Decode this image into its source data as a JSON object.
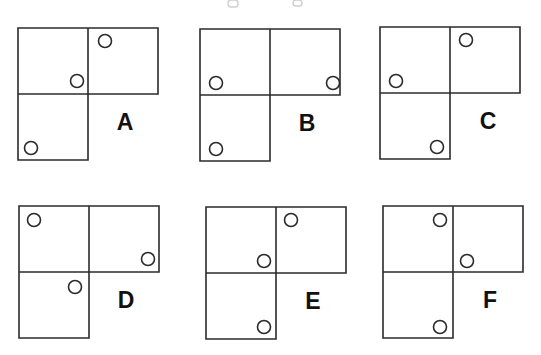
{
  "page": {
    "background_color": "#ffffff",
    "stroke_color": "#2b2b2b",
    "label_color": "#111111",
    "line_width": 1.6,
    "circle_radius": 6.5,
    "circle_stroke_width": 1.6,
    "cell_width": 70,
    "cell_height": 66,
    "label_font_size": 23
  },
  "chart_data": {
    "type": "diagram",
    "shape_description": "Each figure is an L-tromino of three unit squares: top-left, top-right and bottom-left. Each figure carries three small open circles.",
    "figures": [
      {
        "label": "A",
        "origin_x": 18,
        "origin_y": 28,
        "label_x": 125,
        "label_y": 130,
        "squares": [
          "top-left",
          "top-right",
          "bottom-left"
        ],
        "circles": [
          {
            "cx": 105,
            "cy": 41,
            "cell": "top-right",
            "position": "top-left"
          },
          {
            "cx": 77,
            "cy": 81,
            "cell": "top-left",
            "position": "bottom-right"
          },
          {
            "cx": 31,
            "cy": 148,
            "cell": "bottom-left",
            "position": "bottom-left"
          }
        ]
      },
      {
        "label": "B",
        "origin_x": 200,
        "origin_y": 29,
        "label_x": 307,
        "label_y": 131,
        "squares": [
          "top-left",
          "top-right",
          "bottom-left"
        ],
        "circles": [
          {
            "cx": 216,
            "cy": 83,
            "cell": "top-left",
            "position": "bottom-left"
          },
          {
            "cx": 333,
            "cy": 83,
            "cell": "top-right",
            "position": "bottom-right"
          },
          {
            "cx": 216,
            "cy": 149,
            "cell": "bottom-left",
            "position": "bottom-left"
          }
        ]
      },
      {
        "label": "C",
        "origin_x": 380,
        "origin_y": 27,
        "label_x": 488,
        "label_y": 129,
        "squares": [
          "top-left",
          "top-right",
          "bottom-left"
        ],
        "circles": [
          {
            "cx": 466,
            "cy": 40,
            "cell": "top-right",
            "position": "top-left"
          },
          {
            "cx": 396,
            "cy": 81,
            "cell": "top-left",
            "position": "bottom-left"
          },
          {
            "cx": 437,
            "cy": 147,
            "cell": "bottom-left",
            "position": "bottom-right"
          }
        ]
      },
      {
        "label": "D",
        "origin_x": 19,
        "origin_y": 206,
        "label_x": 126,
        "label_y": 308,
        "squares": [
          "top-left",
          "top-right",
          "bottom-left"
        ],
        "circles": [
          {
            "cx": 34,
            "cy": 220,
            "cell": "top-left",
            "position": "top-left"
          },
          {
            "cx": 148,
            "cy": 259,
            "cell": "top-right",
            "position": "bottom-right"
          },
          {
            "cx": 75,
            "cy": 287,
            "cell": "bottom-left",
            "position": "top-right"
          }
        ]
      },
      {
        "label": "E",
        "origin_x": 206,
        "origin_y": 207,
        "label_x": 313,
        "label_y": 309,
        "squares": [
          "top-left",
          "top-right",
          "bottom-left"
        ],
        "circles": [
          {
            "cx": 291,
            "cy": 220,
            "cell": "top-right",
            "position": "top-left"
          },
          {
            "cx": 264,
            "cy": 261,
            "cell": "top-left",
            "position": "bottom-right"
          },
          {
            "cx": 264,
            "cy": 327,
            "cell": "bottom-left",
            "position": "bottom-right"
          }
        ]
      },
      {
        "label": "F",
        "origin_x": 383,
        "origin_y": 206,
        "label_x": 490,
        "label_y": 308,
        "squares": [
          "top-left",
          "top-right",
          "bottom-left"
        ],
        "circles": [
          {
            "cx": 440,
            "cy": 220,
            "cell": "top-left",
            "position": "top-right"
          },
          {
            "cx": 467,
            "cy": 261,
            "cell": "top-right",
            "position": "bottom-left"
          },
          {
            "cx": 440,
            "cy": 327,
            "cell": "bottom-left",
            "position": "bottom-right"
          }
        ]
      }
    ],
    "scan_marks": [
      {
        "x": 228,
        "y": 0,
        "w": 10,
        "h": 7
      },
      {
        "x": 293,
        "y": 0,
        "w": 9,
        "h": 6
      }
    ]
  }
}
